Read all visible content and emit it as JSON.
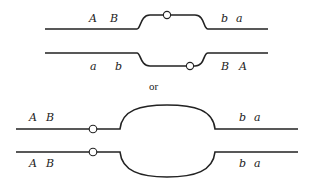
{
  "diagram": {
    "separator": "or",
    "top_pair": {
      "upper_chromatid": {
        "left_labels": [
          "A",
          "B"
        ],
        "right_labels": [
          "b",
          "a"
        ]
      },
      "lower_chromatid": {
        "left_labels": [
          "a",
          "b"
        ],
        "right_labels": [
          "B",
          "A"
        ]
      }
    },
    "bottom_pair": {
      "upper_chromatid": {
        "left_labels": [
          "A",
          "B"
        ],
        "right_labels": [
          "b",
          "a"
        ]
      },
      "lower_chromatid": {
        "left_labels": [
          "A",
          "B"
        ],
        "right_labels": [
          "b",
          "a"
        ]
      }
    },
    "colors": {
      "stroke": "#222222",
      "background": "#ffffff"
    }
  }
}
